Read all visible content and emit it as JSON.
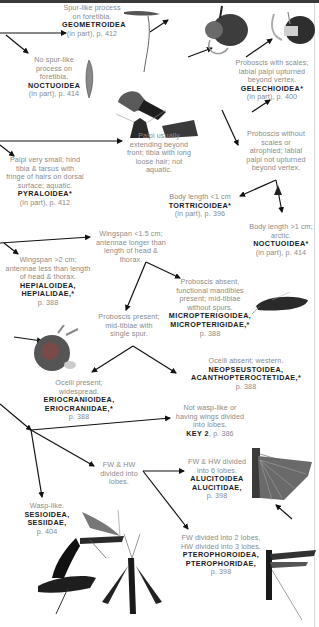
{
  "diagram": {
    "type": "identification-key-flowchart",
    "nodes": {
      "geometroidea": {
        "desc": "Spur-like process on foretibia.",
        "taxon": "GEOMETROIDEA",
        "page": "(in part), p. 412"
      },
      "noctuoidea_1": {
        "desc": "No spur-like process on foretibia.",
        "taxon": "NOCTUOIDEA",
        "page": "(in part), p. 414"
      },
      "gelechioidea": {
        "desc": "Proboscis with scales; labial palpi upturned beyond vertex.",
        "taxon": "GELECHIOIDEA*",
        "page": "(in part), p. 400"
      },
      "palpi_usually": {
        "desc": "Palpi usually extending beyond front; tibia with long loose hair; not aquatic."
      },
      "proboscis_without_scales": {
        "desc": "Proboscis without scales or atrophied; labial palpi not upturned beyond vertex."
      },
      "pyraloidea": {
        "desc": "Palpi very small; hind tibia & tarsus with fringe of hairs on dorsal surface; aquatic.",
        "taxon": "PYRALOIDEA*",
        "page": "(in part), p. 412"
      },
      "tortricoidea": {
        "desc": "Body length <1 cm",
        "taxon": "TORTRICOIDEA*",
        "page": "(in part), p. 396"
      },
      "noctuoidea_2": {
        "desc": "Body length >1 cm; arctic.",
        "taxon": "NOCTUOIDEA*",
        "page": "(in part), p. 414"
      },
      "wingspan_small": {
        "desc": "Wingspan <1.5 cm; antennae longer than length of head & thorax."
      },
      "hepialoidea": {
        "desc": "Wingspan >2 cm; antennae less than length of head & thorax.",
        "taxon": "HEPIALOIDEA, HEPIALIDAE,*",
        "page": "p. 388"
      },
      "micropterigoidea": {
        "desc": "Proboscis absent, functional mandibles present; mid-tibiae without spurs.",
        "taxon": "MICROPTERIGOIDEA, MICROPTERIGIDAE,*",
        "page": "p. 388"
      },
      "proboscis_present": {
        "desc": "Proboscis present; mid-tibiae with single spur."
      },
      "neopseustoidea": {
        "desc": "Ocelli absent; western.",
        "taxon": "NEOPSEUSTOIDEA, ACANTHOPTEROCTETIDAE,*",
        "page": "p. 388"
      },
      "eriocranioidea": {
        "desc": "Ocelli present; widespread.",
        "taxon": "ERIOCRANIOIDEA, ERIOCRANIIDAE,*",
        "page": "p. 388"
      },
      "key2": {
        "desc": "Not wasp-like or having wings divided into lobes.",
        "taxon": "KEY 2",
        "page": ", p. 386"
      },
      "fw_hw_lobes": {
        "desc": "FW & HW divided into lobes."
      },
      "alucitoidea": {
        "desc": "FW & HW divided into 6 lobes.",
        "taxon": "ALUCITOIDEA ALUCITIDAE,",
        "page": "p. 398"
      },
      "sesioidea": {
        "desc": "Wasp-like.",
        "taxon": "SESIOIDEA, SESIIDAE,",
        "page": "p. 404"
      },
      "pterophoroidea": {
        "desc": "FW divided into 2 lobes, HW divided into 3 lobes.",
        "taxon": "PTEROPHOROIDEA, PTEROPHORIDAE,",
        "page": "p. 398"
      }
    },
    "illustrations": [
      "geometrid-foreleg-illustration",
      "noctuid-foreleg-illustration",
      "moth-head-proboscis-illustration",
      "gelechioid-head-palpi-illustration",
      "pyraloid-head-illustration",
      "tortricoid-head-illustration",
      "noctuid-small-head-illustration",
      "micropterigid-moth-illustration",
      "eriocraniid-head-illustration",
      "alucitid-plume-moth-illustration",
      "sesiid-wasp-moth-illustrations",
      "pterophorid-plume-moth-illustration"
    ],
    "colors": {
      "desc_text": "#8a8a8a",
      "taxon_text": "#1a1a1a",
      "arrow": "#111111",
      "top_bar": "#3a3a3a"
    }
  }
}
